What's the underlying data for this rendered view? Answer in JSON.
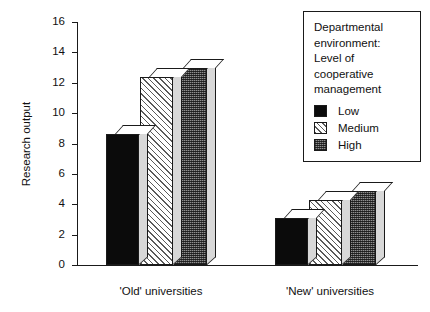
{
  "chart_data": {
    "type": "bar",
    "title": "",
    "xlabel": "",
    "ylabel": "Research output",
    "ylim": [
      0,
      16
    ],
    "yticks": [
      0,
      2,
      4,
      6,
      8,
      10,
      12,
      14,
      16
    ],
    "ytick_labels": [
      "0",
      "2",
      "4",
      "6",
      "8",
      "10",
      "12",
      "14",
      "16"
    ],
    "grid": false,
    "legend_position": "top-right",
    "categories": [
      "'Old' universities",
      "'New' universities"
    ],
    "series": [
      {
        "name": "Low",
        "values": [
          8.6,
          3.1
        ]
      },
      {
        "name": "Medium",
        "values": [
          12.4,
          4.3
        ]
      },
      {
        "name": "High",
        "values": [
          13.0,
          4.9
        ]
      }
    ]
  },
  "legend": {
    "title_lines": [
      "Departmental",
      "environment:",
      "Level of",
      "cooperative",
      "management"
    ],
    "items": [
      {
        "label": "Low",
        "fill": "fill-low",
        "color": "#0b0b0b"
      },
      {
        "label": "Medium",
        "fill": "fill-medium",
        "color": "#ffffff"
      },
      {
        "label": "High",
        "fill": "fill-high",
        "color": "#8f8f8f"
      }
    ]
  },
  "colors": {
    "axis": "#1a1a1a",
    "text": "#111111",
    "background": "#ffffff",
    "bar_top_face": "#ffffff",
    "bar_side_face": "#d8d8d8"
  }
}
